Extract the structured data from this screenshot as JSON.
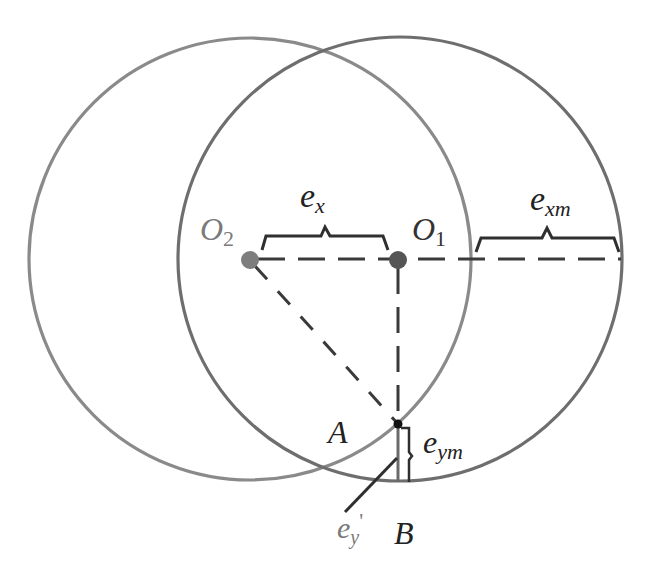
{
  "figure": {
    "colors": {
      "circle_left": "#8a8a8a",
      "circle_right": "#6e6e6e",
      "line_dark": "#3a3a3a",
      "label_dark": "#222222",
      "label_grey": "#7a7a7a",
      "point_grey": "#7d7d7d",
      "point_dark": "#555555",
      "point_black": "#111111"
    },
    "circles": [
      {
        "name": "circle-O2",
        "cx": 250,
        "cy": 259,
        "r": 221
      },
      {
        "name": "circle-O1",
        "cx": 400,
        "cy": 259,
        "r": 222
      }
    ],
    "points": {
      "O2": {
        "x": 250,
        "y": 260
      },
      "O1": {
        "x": 398,
        "y": 260
      },
      "A": {
        "x": 398,
        "y": 424
      }
    },
    "labels": {
      "O2": {
        "main": "O",
        "sub": "2"
      },
      "O1": {
        "main": "O",
        "sub": "1"
      },
      "ex": {
        "main": "e",
        "sub": "x"
      },
      "exm": {
        "main": "e",
        "sub": "xm"
      },
      "eym": {
        "main": "e",
        "sub": "ym"
      },
      "ey_prime": {
        "main": "e",
        "sub": "y",
        "prime": "'"
      },
      "A": "A",
      "B": "B"
    }
  }
}
